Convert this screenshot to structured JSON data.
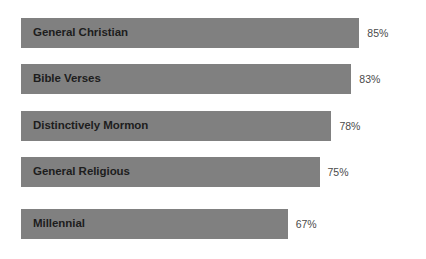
{
  "chart_data": {
    "type": "bar",
    "orientation": "horizontal",
    "title": "",
    "subtitle": "",
    "xlabel": "",
    "ylabel": "",
    "grid": false,
    "legend": false,
    "axis_visible": false,
    "xlim": [
      0,
      100
    ],
    "value_suffix": "%",
    "bar_color": "#808080",
    "label_color": "#1d1d1d",
    "value_color": "#4a4a4a",
    "background_color": "#ffffff",
    "categories": [
      "General Christian",
      "Bible Verses",
      "Distinctively Mormon",
      "General Religious",
      "Millennial"
    ],
    "values": [
      85,
      83,
      78,
      75,
      67
    ],
    "value_labels": [
      "85%",
      "83%",
      "78%",
      "75%",
      "67%"
    ],
    "bars": [
      {
        "label": "General Christian",
        "value": 85,
        "value_label": "85%"
      },
      {
        "label": "Bible Verses",
        "value": 83,
        "value_label": "83%"
      },
      {
        "label": "Distinctively Mormon",
        "value": 78,
        "value_label": "78%"
      },
      {
        "label": "General Religious",
        "value": 75,
        "value_label": "75%"
      },
      {
        "label": "Millennial",
        "value": 67,
        "value_label": "67%"
      }
    ]
  }
}
